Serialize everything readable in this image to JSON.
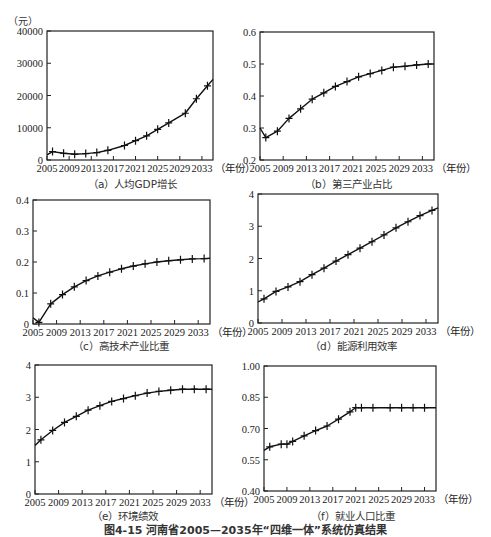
{
  "figure": {
    "caption": "图4-15 河南省2005—2035年“四维一体”系统仿真结果",
    "x_unit": "（年份）"
  },
  "chart_data": [
    {
      "id": "a",
      "type": "line",
      "title": "（a）人均GDP增长",
      "ylabel": "（元）",
      "xlabel": "（年份）",
      "x_ticks": [
        "2005",
        "2009",
        "2013",
        "2017",
        "2021",
        "2025",
        "2029",
        "2033"
      ],
      "y_ticks": [
        "0",
        "10000",
        "20000",
        "30000",
        "40000"
      ],
      "ylim": [
        0,
        40000
      ],
      "xlim": [
        2005,
        2035
      ],
      "x": [
        2005,
        2006,
        2008,
        2010,
        2012,
        2014,
        2016,
        2019,
        2021,
        2023,
        2025,
        2027,
        2030,
        2032,
        2034,
        2035
      ],
      "values": [
        1600,
        2600,
        2100,
        1800,
        2000,
        2300,
        3000,
        4500,
        6000,
        7500,
        9500,
        11500,
        14500,
        19000,
        23000,
        25000
      ],
      "markers": true
    },
    {
      "id": "b",
      "type": "line",
      "title": "（b）第三产业占比",
      "xlabel": "（年份）",
      "x_ticks": [
        "2005",
        "2009",
        "2013",
        "2017",
        "2021",
        "2025",
        "2029",
        "2033"
      ],
      "y_ticks": [
        "0.2",
        "0.3",
        "0.4",
        "0.5",
        "0.6"
      ],
      "ylim": [
        0.2,
        0.6
      ],
      "xlim": [
        2005,
        2035
      ],
      "x": [
        2005,
        2006,
        2008,
        2010,
        2012,
        2014,
        2016,
        2018,
        2020,
        2022,
        2024,
        2026,
        2028,
        2030,
        2032,
        2034,
        2035
      ],
      "values": [
        0.3,
        0.27,
        0.29,
        0.33,
        0.36,
        0.39,
        0.41,
        0.43,
        0.445,
        0.46,
        0.47,
        0.48,
        0.49,
        0.493,
        0.497,
        0.5,
        0.5
      ],
      "markers": true
    },
    {
      "id": "c",
      "type": "line",
      "title": "（c）高技术产业比重",
      "xlabel": "（年份）",
      "x_ticks": [
        "2005",
        "2009",
        "2013",
        "2017",
        "2021",
        "2025",
        "2029",
        "2033"
      ],
      "y_ticks": [
        "0",
        "0.1",
        "0.2",
        "0.3",
        "0.4"
      ],
      "ylim": [
        0,
        0.4
      ],
      "xlim": [
        2005,
        2035
      ],
      "x": [
        2005,
        2006,
        2008,
        2010,
        2012,
        2014,
        2016,
        2018,
        2020,
        2022,
        2024,
        2026,
        2028,
        2030,
        2032,
        2034,
        2035
      ],
      "values": [
        0.02,
        0.005,
        0.065,
        0.095,
        0.12,
        0.14,
        0.155,
        0.167,
        0.178,
        0.187,
        0.194,
        0.2,
        0.204,
        0.207,
        0.21,
        0.211,
        0.212
      ],
      "markers": true
    },
    {
      "id": "d",
      "type": "line",
      "title": "（d）能源利用效率",
      "xlabel": "（年份）",
      "x_ticks": [
        "2005",
        "2009",
        "2013",
        "2017",
        "2021",
        "2025",
        "2029",
        "2033"
      ],
      "y_ticks": [
        "0",
        "1",
        "2",
        "3",
        "4"
      ],
      "ylim": [
        0,
        4
      ],
      "xlim": [
        2005,
        2035
      ],
      "x": [
        2005,
        2006,
        2008,
        2010,
        2012,
        2014,
        2016,
        2018,
        2020,
        2022,
        2024,
        2026,
        2028,
        2030,
        2032,
        2034,
        2035
      ],
      "values": [
        0.65,
        0.75,
        0.98,
        1.12,
        1.28,
        1.5,
        1.7,
        1.92,
        2.12,
        2.32,
        2.52,
        2.73,
        2.95,
        3.14,
        3.33,
        3.49,
        3.57
      ],
      "markers": true
    },
    {
      "id": "e",
      "type": "line",
      "title": "（e）环境绩效",
      "xlabel": "（年份）",
      "x_ticks": [
        "2005",
        "2009",
        "2013",
        "2017",
        "2021",
        "2025",
        "2029",
        "2033"
      ],
      "y_ticks": [
        "0",
        "1",
        "2",
        "3",
        "4"
      ],
      "ylim": [
        0,
        4
      ],
      "xlim": [
        2005,
        2035
      ],
      "x": [
        2005,
        2006,
        2008,
        2010,
        2012,
        2014,
        2016,
        2018,
        2020,
        2022,
        2024,
        2026,
        2028,
        2030,
        2032,
        2034,
        2035
      ],
      "values": [
        1.5,
        1.68,
        1.97,
        2.22,
        2.41,
        2.6,
        2.74,
        2.87,
        2.96,
        3.05,
        3.13,
        3.18,
        3.22,
        3.25,
        3.25,
        3.25,
        3.25
      ],
      "markers": true
    },
    {
      "id": "f",
      "type": "line",
      "title": "（f）就业人口比重",
      "xlabel": "（年份）",
      "x_ticks": [
        "2005",
        "2009",
        "2013",
        "2017",
        "2021",
        "2025",
        "2029",
        "2033"
      ],
      "y_ticks": [
        "0.40",
        "0.55",
        "0.70",
        "0.85",
        "1.00"
      ],
      "ylim": [
        0.4,
        1.0
      ],
      "xlim": [
        2005,
        2035
      ],
      "x": [
        2005,
        2006,
        2008,
        2009,
        2010,
        2012,
        2014,
        2016,
        2018,
        2020,
        2021,
        2022,
        2024,
        2027,
        2029,
        2031,
        2033,
        2035
      ],
      "values": [
        0.595,
        0.612,
        0.625,
        0.625,
        0.638,
        0.665,
        0.69,
        0.712,
        0.745,
        0.78,
        0.8,
        0.8,
        0.8,
        0.8,
        0.8,
        0.8,
        0.8,
        0.8
      ],
      "markers": true
    }
  ]
}
